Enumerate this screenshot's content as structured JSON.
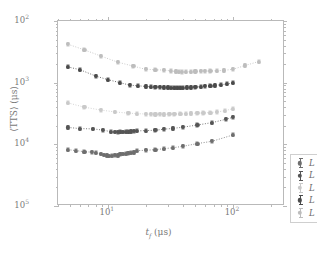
{
  "figure": {
    "xaxis_title_sym": "t",
    "xaxis_title_sub": "f",
    "xaxis_title_unit": "(μs)",
    "yaxis_title": "⟨TTS⟩ (μs)",
    "x_tick_labels": [
      "10",
      "10"
    ],
    "x_tick_exponents": [
      "1",
      "2"
    ],
    "y_tick_labels": [
      "10",
      "10",
      "10",
      "10"
    ],
    "y_tick_exponents": [
      "5",
      "4",
      "3",
      "2"
    ]
  },
  "legend": {
    "entries": [
      {
        "label_sym": "L",
        "label_eq": "= 12",
        "color": "#6e6e6e"
      },
      {
        "label_sym": "L",
        "label_eq": "= 13",
        "color": "#555555"
      },
      {
        "label_sym": "L",
        "label_eq": "= 14",
        "color": "#c9c9c9"
      },
      {
        "label_sym": "L",
        "label_eq": "= 15",
        "color": "#4a4a4a"
      },
      {
        "label_sym": "L",
        "label_eq": "= 16",
        "color": "#bdbdbd"
      }
    ]
  },
  "chart_data": {
    "type": "scatter",
    "title": "",
    "xlabel": "t_f (μs)",
    "ylabel": "⟨TTS⟩ (μs)",
    "xscale": "log",
    "yscale": "log",
    "xlim": [
      4.0,
      260.0
    ],
    "ylim": [
      100,
      100000
    ],
    "grid": false,
    "legend_position": "lower right",
    "x_ticks": [
      10,
      100
    ],
    "y_ticks": [
      100,
      1000,
      10000,
      100000
    ],
    "series": [
      {
        "name": "L = 12",
        "color": "#6e6e6e",
        "marker": "circle",
        "linestyle": "dotted",
        "x": [
          4.8,
          5.6,
          6.5,
          7.5,
          8.0,
          8.8,
          9.3,
          9.8,
          10.2,
          10.8,
          11.4,
          12.0,
          12.6,
          13.2,
          13.9,
          14.6,
          15.3,
          16.1,
          17.0,
          20.0,
          24.0,
          28.0,
          33.0,
          40.0,
          52.0,
          68.0,
          100.0
        ],
        "y": [
          820,
          790,
          760,
          745,
          735,
          700,
          670,
          660,
          650,
          655,
          665,
          660,
          690,
          700,
          710,
          720,
          730,
          740,
          790,
          800,
          820,
          850,
          880,
          930,
          1030,
          1120,
          1420
        ],
        "yerr": [
          45,
          42,
          40,
          38,
          38,
          36,
          34,
          34,
          34,
          34,
          34,
          34,
          36,
          36,
          36,
          38,
          38,
          38,
          40,
          42,
          44,
          46,
          48,
          50,
          55,
          62,
          80
        ]
      },
      {
        "name": "L = 13",
        "color": "#555555",
        "marker": "circle",
        "linestyle": "dotted",
        "x": [
          4.8,
          6.0,
          7.6,
          9.2,
          10.6,
          11.4,
          12.0,
          12.6,
          13.2,
          13.9,
          14.6,
          15.3,
          16.1,
          17.0,
          20.0,
          24.0,
          28.0,
          33.0,
          40.0,
          52.0,
          68.0,
          88.0,
          100.0
        ],
        "y": [
          1880,
          1800,
          1780,
          1700,
          1600,
          1590,
          1580,
          1600,
          1590,
          1600,
          1610,
          1620,
          1630,
          1650,
          1670,
          1690,
          1760,
          1810,
          1900,
          2060,
          2250,
          2550,
          2750
        ],
        "yerr": [
          100,
          95,
          92,
          88,
          85,
          85,
          85,
          85,
          85,
          85,
          85,
          88,
          88,
          90,
          92,
          95,
          98,
          102,
          108,
          118,
          130,
          150,
          165
        ]
      },
      {
        "name": "L = 14",
        "color": "#c9c9c9",
        "marker": "circle",
        "linestyle": "dotted",
        "x": [
          4.8,
          6.5,
          8.8,
          11.4,
          14.6,
          17.0,
          20.0,
          22.0,
          24.0,
          26.0,
          28.0,
          31.0,
          34.0,
          38.0,
          42.0,
          46.0,
          52.0,
          58.0,
          66.0,
          74.0,
          86.0,
          100.0
        ],
        "y": [
          4700,
          4000,
          3600,
          3350,
          3200,
          3150,
          3100,
          3080,
          3060,
          3080,
          3060,
          3080,
          3100,
          3120,
          3150,
          3180,
          3200,
          3230,
          3280,
          3350,
          3500,
          3800
        ],
        "yerr": [
          260,
          220,
          200,
          185,
          178,
          175,
          172,
          170,
          170,
          170,
          170,
          172,
          174,
          176,
          178,
          180,
          182,
          185,
          190,
          196,
          205,
          225
        ]
      },
      {
        "name": "L = 15",
        "color": "#4a4a4a",
        "marker": "circle",
        "linestyle": "dotted",
        "x": [
          4.8,
          6.0,
          8.0,
          10.0,
          12.5,
          15.0,
          17.5,
          20.0,
          22.0,
          24.0,
          26.0,
          28.0,
          30.0,
          32.0,
          34.0,
          36.0,
          38.0,
          40.0,
          43.0,
          46.0,
          50.0,
          55.0,
          60.0,
          66.0,
          72.0,
          80.0,
          90.0,
          100.0
        ],
        "y": [
          18000,
          16200,
          12800,
          11200,
          10000,
          9100,
          8900,
          8700,
          8600,
          8500,
          8450,
          8400,
          8350,
          8300,
          8280,
          8250,
          8280,
          8300,
          8350,
          8400,
          8500,
          8600,
          8750,
          8900,
          9050,
          9250,
          9550,
          9900
        ],
        "yerr": [
          1000,
          900,
          720,
          630,
          560,
          510,
          500,
          490,
          485,
          480,
          475,
          470,
          468,
          465,
          463,
          462,
          463,
          465,
          468,
          472,
          478,
          485,
          494,
          502,
          512,
          523,
          540,
          560
        ]
      },
      {
        "name": "L = 16",
        "color": "#bdbdbd",
        "marker": "circle",
        "linestyle": "dotted",
        "x": [
          4.8,
          6.5,
          8.8,
          12.0,
          16.0,
          20.0,
          24.0,
          28.0,
          32.0,
          35.0,
          37.0,
          39.0,
          42.0,
          46.0,
          50.0,
          55.0,
          60.0,
          66.0,
          74.0,
          84.0,
          100.0,
          125.0,
          160.0
        ],
        "y": [
          42000,
          34000,
          27000,
          21500,
          18500,
          16500,
          16200,
          16000,
          15500,
          15200,
          15000,
          14900,
          15000,
          15100,
          15200,
          15300,
          15400,
          15500,
          15600,
          15800,
          16500,
          19000,
          22000
        ],
        "yerr": [
          2400,
          1950,
          1550,
          1230,
          1060,
          950,
          930,
          920,
          890,
          875,
          862,
          856,
          862,
          868,
          874,
          880,
          885,
          890,
          896,
          908,
          948,
          1090,
          1265
        ]
      }
    ]
  }
}
